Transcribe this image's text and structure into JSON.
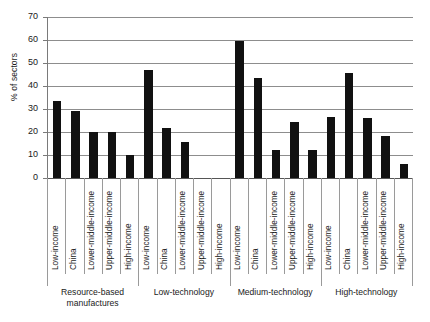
{
  "chart": {
    "type": "bar",
    "title": "",
    "ylabel": "% of sectors",
    "xlabel": ""
  },
  "chart_data": {
    "type": "bar",
    "title": "",
    "subtitle": "",
    "xlabel": "",
    "ylabel": "% of sectors",
    "ylim": [
      0,
      70
    ],
    "ytick_step": 10,
    "yticks": [
      70,
      60,
      50,
      40,
      30,
      20,
      10,
      0
    ],
    "grid": true,
    "legend": "none",
    "bar_color": "#111111",
    "group_names": [
      "Resource-based manufactures",
      "Low-technology",
      "Medium-technology",
      "High-technology"
    ],
    "categories": [
      "Low-income",
      "China",
      "Lower-middle-income",
      "Upper-middle-income",
      "High-income"
    ],
    "series": [
      {
        "name": "Resource-based manufactures",
        "values": [
          33.5,
          29.0,
          19.8,
          19.8,
          9.8
        ]
      },
      {
        "name": "Low-technology",
        "values": [
          47.0,
          21.8,
          15.6,
          0,
          0
        ]
      },
      {
        "name": "Medium-technology",
        "values": [
          59.5,
          43.5,
          12.0,
          24.5,
          12.0
        ]
      },
      {
        "name": "High-technology",
        "values": [
          26.5,
          45.5,
          26.3,
          18.4,
          6.0
        ]
      }
    ]
  }
}
